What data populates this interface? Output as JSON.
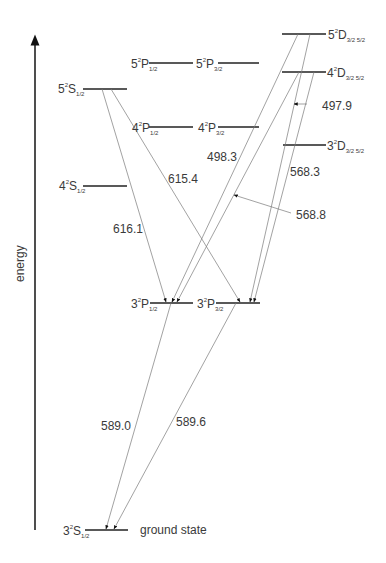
{
  "diagram": {
    "axis_label": "energy",
    "levels": [
      {
        "id": "5S",
        "n": "5",
        "term": "S",
        "j": "1/2"
      },
      {
        "id": "4S",
        "n": "4",
        "term": "S",
        "j": "1/2"
      },
      {
        "id": "5P12",
        "n": "5",
        "term": "P",
        "j": "1/2"
      },
      {
        "id": "5P32",
        "n": "5",
        "term": "P",
        "j": "3/2"
      },
      {
        "id": "4P12",
        "n": "4",
        "term": "P",
        "j": "1/2"
      },
      {
        "id": "4P32",
        "n": "4",
        "term": "P",
        "j": "3/2"
      },
      {
        "id": "5D",
        "n": "5",
        "term": "D",
        "j": "3/2 5/2"
      },
      {
        "id": "4D",
        "n": "4",
        "term": "D",
        "j": "3/2 5/2"
      },
      {
        "id": "3D",
        "n": "3",
        "term": "D",
        "j": "3/2 5/2"
      },
      {
        "id": "3P12",
        "n": "3",
        "term": "P",
        "j": "1/2"
      },
      {
        "id": "3P32",
        "n": "3",
        "term": "P",
        "j": "3/2"
      },
      {
        "id": "3S",
        "n": "3",
        "term": "S",
        "j": "1/2",
        "note": "ground state"
      }
    ],
    "multiplicity": "2",
    "transitions": [
      {
        "from": "5S",
        "to": "3P12",
        "wavelength": "616.1"
      },
      {
        "from": "5S",
        "to": "3P32",
        "wavelength": "615.4"
      },
      {
        "from": "5D",
        "to": "3P12",
        "wavelength": "498.3"
      },
      {
        "from": "4D",
        "to": "3P12",
        "wavelength": "568.8"
      },
      {
        "from": "5D",
        "to": "3P32",
        "wavelength": "497.9"
      },
      {
        "from": "4D",
        "to": "3P32",
        "wavelength": "568.3"
      },
      {
        "from": "3P12",
        "to": "3S",
        "wavelength": "589.6"
      },
      {
        "from": "3P32",
        "to": "3S",
        "wavelength": "589.0"
      }
    ]
  }
}
